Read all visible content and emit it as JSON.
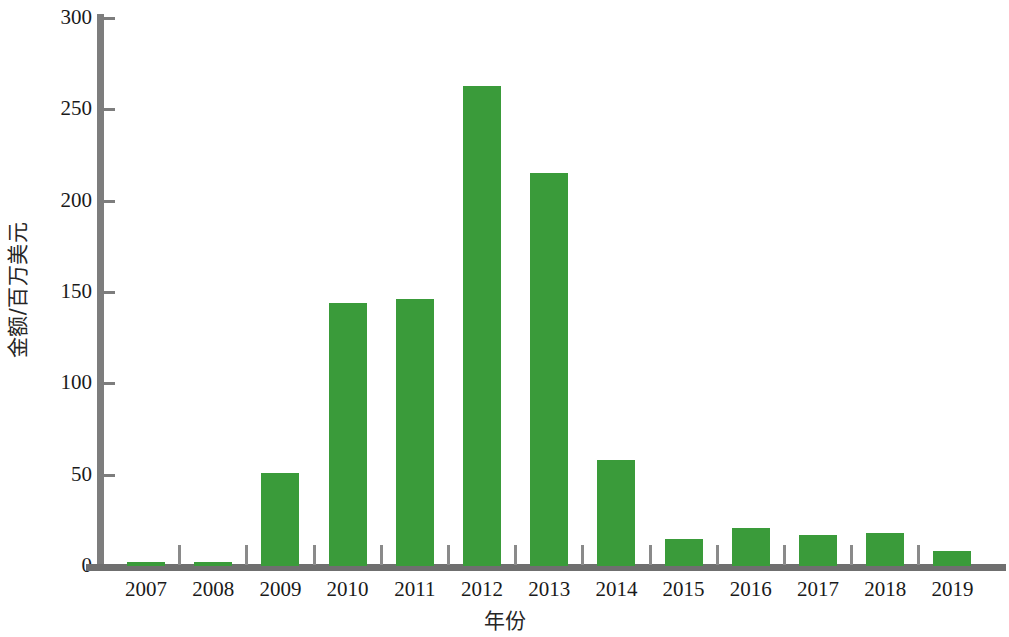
{
  "chart_data": {
    "type": "bar",
    "title": "",
    "xlabel": "年份",
    "ylabel": "金额/百万美元",
    "categories": [
      "2007",
      "2008",
      "2009",
      "2010",
      "2011",
      "2012",
      "2013",
      "2014",
      "2015",
      "2016",
      "2017",
      "2018",
      "2019"
    ],
    "values": [
      2,
      2,
      51,
      144,
      146,
      263,
      215,
      58,
      15,
      21,
      17,
      18,
      8
    ],
    "series": [
      {
        "name": "金额/百万美元",
        "values": [
          2,
          2,
          51,
          144,
          146,
          263,
          215,
          58,
          15,
          21,
          17,
          18,
          8
        ]
      }
    ],
    "ylim": [
      0,
      300
    ],
    "y_ticks": [
      0,
      50,
      100,
      150,
      200,
      250,
      300
    ],
    "y_tick_labels": [
      "0",
      "50",
      "100",
      "150",
      "200",
      "250",
      "300"
    ],
    "grid": false,
    "legend": false,
    "legend_position": "none",
    "bar_color": "#3a9b3a",
    "axis_color": "#7d7d7d"
  },
  "axes": {
    "y_title": "金额/百万美元",
    "x_title": "年份"
  }
}
